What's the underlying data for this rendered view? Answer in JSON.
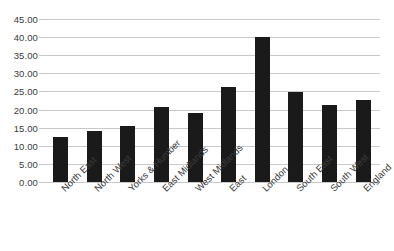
{
  "chart_data": {
    "type": "bar",
    "title": "",
    "subtitle": "",
    "xlabel": "",
    "ylabel": "",
    "categories": [
      "North East",
      "North West",
      "Yorks & Humber",
      "East Midlands",
      "West Midlands",
      "East",
      "London",
      "South East",
      "South West",
      "England"
    ],
    "values": [
      12.4,
      14.2,
      15.4,
      20.6,
      19.0,
      26.1,
      40.0,
      24.9,
      21.4,
      22.6
    ],
    "ylim": [
      0,
      45
    ],
    "ytick_step": 5,
    "ytick_labels": [
      "45.00",
      "40.00",
      "35.00",
      "30.00",
      "25.00",
      "20.00",
      "15.00",
      "10.00",
      "5.00",
      "0.00"
    ],
    "ytick_values": [
      45,
      40,
      35,
      30,
      25,
      20,
      15,
      10,
      5,
      0
    ],
    "grid": true,
    "grid_axis": "y",
    "legend": false,
    "legend_position": "none",
    "bar_color": "#1a1a1a",
    "gridline_color": "#c9c9c9",
    "text_color": "#3b3b3b",
    "background_color": "#ffffff",
    "xtick_label_rotation": -45
  }
}
